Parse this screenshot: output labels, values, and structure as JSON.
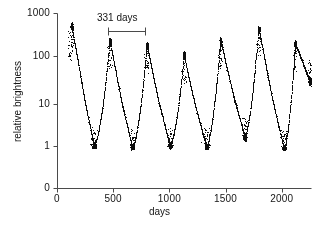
{
  "figure": {
    "xlabel": "days",
    "ylabel": "relative brightness",
    "annotation_label": "331 days"
  },
  "axes": {
    "x_ticks": [
      "0",
      "500",
      "1000",
      "1500",
      "2000"
    ],
    "y_ticks": [
      "1000",
      "100",
      "10",
      "1",
      "0"
    ]
  },
  "chart_data": {
    "type": "scatter",
    "title": "",
    "xlabel": "days",
    "ylabel": "relative brightness",
    "xlim": [
      0,
      2250
    ],
    "ylim_log": [
      1,
      1000
    ],
    "yscale": "log-with-zero-break",
    "grid": false,
    "legend": null,
    "x_ticks": [
      0,
      500,
      1000,
      1500,
      2000
    ],
    "y_ticks": [
      0,
      1,
      10,
      100,
      1000
    ],
    "annotations": [
      {
        "text": "331 days",
        "type": "period-bar",
        "x_start": 450,
        "x_end": 781,
        "y": 420
      }
    ],
    "period_days": 331,
    "series": [
      {
        "name": "relative brightness",
        "marker": "dot",
        "color": "#111111",
        "cycles": [
          {
            "peak_day": 130,
            "peak_value": 520,
            "min_day": 330,
            "min_value": 1.0
          },
          {
            "peak_day": 470,
            "peak_value": 230,
            "min_day": 670,
            "min_value": 0.9
          },
          {
            "peak_day": 800,
            "peak_value": 180,
            "min_day": 1005,
            "min_value": 1.0
          },
          {
            "peak_day": 1130,
            "peak_value": 110,
            "min_day": 1330,
            "min_value": 0.95
          },
          {
            "peak_day": 1455,
            "peak_value": 230,
            "min_day": 1670,
            "min_value": 1.7
          },
          {
            "peak_day": 1795,
            "peak_value": 430,
            "min_day": 2020,
            "min_value": 0.85
          },
          {
            "peak_day": 2120,
            "peak_value": 200,
            "min_day": 2250,
            "min_value": 30
          }
        ],
        "points_note": "dense photometric sampling; each cycle rises steeply to maximum then decays to minimum"
      }
    ]
  }
}
